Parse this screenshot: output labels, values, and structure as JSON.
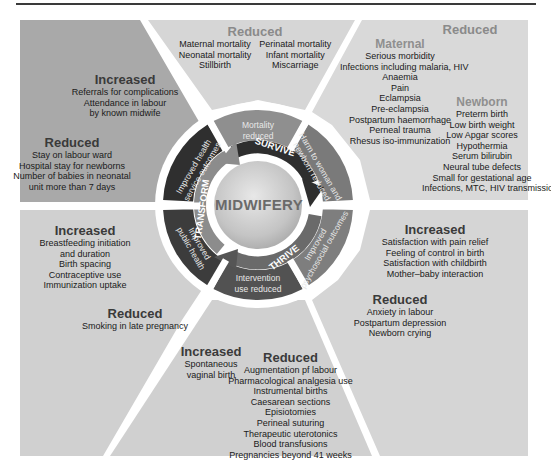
{
  "center": {
    "label": "MIDWIFERY"
  },
  "cycle": {
    "survive": "SURVIVE",
    "thrive": "THRIVE",
    "transform": "TRANSFORM"
  },
  "ring_segments": [
    {
      "id": "mortality",
      "label_line1": "Mortality",
      "label_line2": "reduced"
    },
    {
      "id": "harm",
      "label_line1": "Harm to woman and",
      "label_line2": "newborn reduced"
    },
    {
      "id": "psychosocial",
      "label_line1": "Improved",
      "label_line2": "psychosocial outcomes"
    },
    {
      "id": "intervention",
      "label_line1": "Intervention",
      "label_line2": "use reduced"
    },
    {
      "id": "public_health",
      "label_line1": "Improved",
      "label_line2": "public health"
    },
    {
      "id": "service",
      "label_line1": "Improved health",
      "label_line2": "service outcomes"
    }
  ],
  "panels": {
    "top_center": {
      "heading": "Reduced",
      "col1": [
        "Maternal mortality",
        "Neonatal mortality",
        "Stillbirth"
      ],
      "col2": [
        "Perinatal mortality",
        "Infant mortality",
        "Miscarriage"
      ]
    },
    "top_right": {
      "heading": "Reduced",
      "maternal_heading": "Maternal",
      "maternal": [
        "Serious morbidity",
        "Infections including malaria, HIV",
        "Anaemia",
        "Pain",
        "Eclampsia",
        "Pre-eclampsia",
        "Postpartum haemorrhage",
        "Perneal trauma",
        "Rhesus iso-immunization"
      ],
      "newborn_heading": "Newborn",
      "newborn": [
        "Preterm birth",
        "Low birth weight",
        "Low Apgar scores",
        "Hypothermia",
        "Serum bilirubin",
        "Neural tube defects",
        "Small for gestational age",
        "Infections, MTC, HIV transmission"
      ]
    },
    "top_left": {
      "increased_heading": "Increased",
      "increased": [
        "Referrals for complications",
        "Attendance in labour",
        "by known midwife"
      ],
      "reduced_heading": "Reduced",
      "reduced": [
        "Stay on labour ward",
        "Hospital stay for newborns",
        "Number of babies in neonatal",
        "unit more than 7 days"
      ]
    },
    "bottom_left": {
      "increased_heading": "Increased",
      "increased": [
        "Breastfeeding initiation",
        "and duration",
        "Birth spacing",
        "Contraceptive use",
        "Immunization uptake"
      ],
      "reduced_heading": "Reduced",
      "reduced": [
        "Smoking in late pregnancy"
      ]
    },
    "bottom_right": {
      "increased_heading": "Increased",
      "increased": [
        "Satisfaction with pain relief",
        "Feeling of control in birth",
        "Satisfaction with childbirth",
        "Mother–baby interaction"
      ],
      "reduced_heading": "Reduced",
      "reduced": [
        "Anxiety in labour",
        "Postpartum depression",
        "Newborn crying"
      ]
    },
    "bottom_center": {
      "increased_heading": "Increased",
      "increased": [
        "Spontaneous",
        "vaginal birth"
      ],
      "reduced_heading": "Reduced",
      "reduced": [
        "Augmentation pf labour",
        "Pharmacological analgesia use",
        "Instrumental births",
        "Caesarean sections",
        "Episiotomies",
        "Perineal suturing",
        "Therapeutic uterotonics",
        "Blood transfusions",
        "Pregnancies beyond 41 weeks"
      ]
    }
  },
  "colors": {
    "panel_dark": "#a9a9a9",
    "panel_mid": "#c6c6c6",
    "panel_light": "#d9d9d9",
    "panel_bottom": "#d2d2d2",
    "ring_dark": "#3c3c3c",
    "ring_mid": "#6f6f6f",
    "ring_light": "#909090",
    "arrow_dark": "#2e2e2e",
    "arrow_light": "#8a8a8a",
    "center_fill": "#c9c9c9"
  }
}
